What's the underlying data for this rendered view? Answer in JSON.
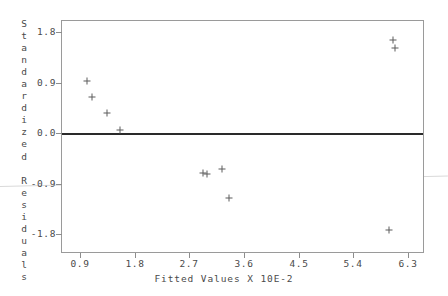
{
  "chart_data": {
    "type": "scatter",
    "title": "",
    "subtitle": "",
    "xlabel": "Fitted Values X 10E-2",
    "ylabel": "Standardized Residuals",
    "xlim": [
      0.45,
      6.75
    ],
    "ylim": [
      -2.05,
      2.05
    ],
    "xticks": [
      "0.9",
      "1.8",
      "2.7",
      "3.6",
      "4.5",
      "5.4",
      "6.3"
    ],
    "xtick_values": [
      0.9,
      1.8,
      2.7,
      3.6,
      4.5,
      5.4,
      6.3
    ],
    "yticks": [
      "1.8",
      "0.9",
      "0.0",
      "-0.9",
      "-1.8"
    ],
    "ytick_values": [
      1.8,
      0.9,
      0.0,
      -0.9,
      -1.8
    ],
    "grid": false,
    "legend": "none",
    "reference_lines": [
      {
        "name": "zero-line",
        "orientation": "horizontal",
        "y": 0.0,
        "style": "solid",
        "color": "#2a2a2a"
      }
    ],
    "points": [
      {
        "x": 1.01,
        "y": 0.93
      },
      {
        "x": 1.1,
        "y": 0.64
      },
      {
        "x": 1.35,
        "y": 0.36
      },
      {
        "x": 1.55,
        "y": 0.05
      },
      {
        "x": 2.93,
        "y": -0.72
      },
      {
        "x": 2.99,
        "y": -0.73
      },
      {
        "x": 3.23,
        "y": -0.64
      },
      {
        "x": 3.35,
        "y": -1.15
      },
      {
        "x": 6.05,
        "y": 1.66
      },
      {
        "x": 6.08,
        "y": 1.52
      },
      {
        "x": 5.98,
        "y": -1.73
      }
    ]
  },
  "axis": {
    "y_title_letters": [
      "S",
      "t",
      "a",
      "n",
      "d",
      "a",
      "r",
      "d",
      "i",
      "z",
      "e",
      "d",
      "",
      "R",
      "e",
      "s",
      "i",
      "d",
      "u",
      "a",
      "l",
      "s"
    ]
  },
  "colors": {
    "frame": "#9a9a9a",
    "marker": "#5d5d5d",
    "zero_line": "#2a2a2a",
    "text": "#4a4a4a",
    "background": "#ffffff"
  }
}
